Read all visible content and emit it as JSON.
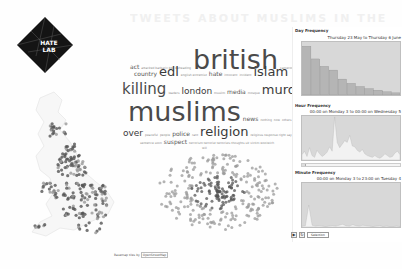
{
  "background_text": "TWEETS ABOUT MUSLIMS IN THE UK FOLLOWING WOOLWICH",
  "logo": {
    "line1": "HATE",
    "line2": "LAB",
    "bg_color": "#141414",
    "fg_color": "#ffffff"
  },
  "wordcloud": {
    "words": [
      {
        "text": "act",
        "size": "s"
      },
      {
        "text": "attacked barbaric bbc beheading",
        "size": "xs"
      },
      {
        "text": "british",
        "size": "xxl"
      },
      {
        "text": "cameron community",
        "size": "xs"
      },
      {
        "text": "country",
        "size": "s"
      },
      {
        "text": "edl",
        "size": "l"
      },
      {
        "text": "english extremist",
        "size": "xs"
      },
      {
        "text": "hate",
        "size": "s"
      },
      {
        "text": "innocent",
        "size": "xs"
      },
      {
        "text": "incident",
        "size": "xs"
      },
      {
        "text": "islam",
        "size": "l"
      },
      {
        "text": "killing",
        "size": "xl"
      },
      {
        "text": "leaders",
        "size": "xs"
      },
      {
        "text": "london",
        "size": "m"
      },
      {
        "text": "muslim",
        "size": "xs"
      },
      {
        "text": "media",
        "size": "s"
      },
      {
        "text": "mosque",
        "size": "xs"
      },
      {
        "text": "murder",
        "size": "l"
      },
      {
        "text": "muslims",
        "size": "xxl"
      },
      {
        "text": "news",
        "size": "s"
      },
      {
        "text": "nothing",
        "size": "xs"
      },
      {
        "text": "now",
        "size": "xs"
      },
      {
        "text": "others",
        "size": "xs"
      },
      {
        "text": "one",
        "size": "m"
      },
      {
        "text": "out",
        "size": "m"
      },
      {
        "text": "over",
        "size": "m"
      },
      {
        "text": "peaceful",
        "size": "xs"
      },
      {
        "text": "people",
        "size": "xs"
      },
      {
        "text": "police",
        "size": "s"
      },
      {
        "text": "rant",
        "size": "xs"
      },
      {
        "text": "religion",
        "size": "l"
      },
      {
        "text": "religious response right say soldier street",
        "size": "xs"
      },
      {
        "text": "sentence soon",
        "size": "xs"
      },
      {
        "text": "suspect",
        "size": "s"
      },
      {
        "text": "terrorism terrorist terrorists thoughts uk victim woolwich",
        "size": "xs"
      },
      {
        "text": "will",
        "size": "xs"
      }
    ]
  },
  "attribution": {
    "text": "Basemap tiles by",
    "link": "OpenStreetMap"
  },
  "charts": [
    {
      "title": "Day Frequency",
      "range": "Thursday 23 May to Thursday 6 June",
      "type": "bar",
      "yticks": [
        "",
        "",
        "",
        "",
        "",
        ""
      ],
      "values": [
        92,
        68,
        54,
        47,
        30,
        22,
        16,
        12,
        9,
        6,
        4
      ]
    },
    {
      "title": "Hour Frequency",
      "range": "00:00 on Monday 3 to 00:00 on Wednesday 5",
      "type": "area",
      "values": [
        12,
        20,
        8,
        28,
        10,
        6,
        22,
        14,
        8,
        12,
        18,
        30,
        20,
        98,
        40,
        28,
        36,
        44,
        40,
        56,
        32,
        30,
        22,
        18,
        24,
        14,
        10,
        8,
        6,
        10,
        6,
        4,
        8,
        14,
        10,
        6,
        8,
        16,
        20,
        12
      ]
    },
    {
      "title": "Minute Frequency",
      "range": "00:00 on Monday 3 to 23:00 on Tuesday 4",
      "type": "area",
      "values": [
        2,
        3,
        50,
        4,
        2,
        3,
        2,
        1,
        2,
        3,
        2,
        4,
        6,
        3,
        2,
        5,
        3,
        2,
        4,
        3,
        2,
        1,
        2,
        3,
        1,
        2,
        1,
        1,
        2,
        1
      ]
    }
  ],
  "controls": {
    "play_icon": "▶",
    "reset_icon": "↻",
    "select_label": "Selection"
  },
  "map_colors": {
    "dot": "#555555",
    "dot_light": "#999999",
    "coast": "#e6e6e6"
  },
  "chart_colors": {
    "bg": "#d8d8d8",
    "fill": "#f2f2f2",
    "bar": "#b5b5b5",
    "bar_edge": "#8a8a8a"
  }
}
